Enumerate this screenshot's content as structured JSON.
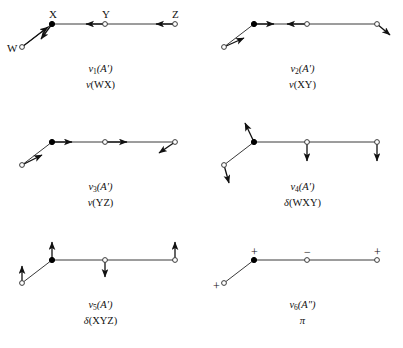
{
  "figure": {
    "background_color": "#ffffff",
    "line_color": "#3a3a3a",
    "marker_fill_color": "#000000",
    "marker_open_color": "#ffffff",
    "arrow_color": "#111111",
    "atom_labels": [
      "W",
      "X",
      "Y",
      "Z"
    ]
  },
  "panels": [
    {
      "id": "mode-1",
      "mode_label": "ν",
      "mode_index": "1",
      "symmetry": "(A′)",
      "coordinate_symbol": "ν",
      "coordinate_group": "(WX)",
      "caption_line1": "ν₁(A′)",
      "caption_line2": "ν(WX)",
      "show_atom_labels": true,
      "atoms": [
        {
          "name": "W",
          "x": 22,
          "y": 47,
          "type": "open",
          "label": "W",
          "label_dx": -15,
          "label_dy": -4
        },
        {
          "name": "X",
          "x": 52,
          "y": 24,
          "type": "filled",
          "label": "X",
          "label_dx": -3,
          "label_dy": -15
        },
        {
          "name": "Y",
          "x": 105,
          "y": 24,
          "type": "open",
          "label": "Y",
          "label_dx": -3,
          "label_dy": -15
        },
        {
          "name": "Z",
          "x": 175,
          "y": 24,
          "type": "open",
          "label": "Z",
          "label_dx": -3,
          "label_dy": -15
        }
      ],
      "arrows": [
        {
          "atom": "W",
          "dx": 26,
          "dy": -20,
          "len": 33,
          "kind": "diagonal-up-right"
        },
        {
          "atom": "X",
          "dx": -11,
          "dy": 15,
          "len": 19,
          "kind": "diagonal-down-left"
        },
        {
          "atom": "Y",
          "dx": -19,
          "dy": 0,
          "len": 19,
          "kind": "left"
        },
        {
          "atom": "Z",
          "dx": -19,
          "dy": 0,
          "len": 19,
          "kind": "left"
        }
      ],
      "signs": []
    },
    {
      "id": "mode-2",
      "mode_label": "ν",
      "mode_index": "2",
      "symmetry": "(A′)",
      "coordinate_symbol": "ν",
      "coordinate_group": "(XY)",
      "caption_line1": "ν₂(A′)",
      "caption_line2": "ν(XY)",
      "show_atom_labels": false,
      "atoms": [
        {
          "name": "W",
          "x": 22,
          "y": 47,
          "type": "open"
        },
        {
          "name": "X",
          "x": 52,
          "y": 24,
          "type": "filled"
        },
        {
          "name": "Y",
          "x": 105,
          "y": 24,
          "type": "open"
        },
        {
          "name": "Z",
          "x": 175,
          "y": 24,
          "type": "open"
        }
      ],
      "arrows": [
        {
          "atom": "W",
          "dx": 20,
          "dy": -9,
          "len": 22,
          "kind": "diagonal-up-right"
        },
        {
          "atom": "X",
          "dx": 20,
          "dy": 0,
          "len": 20,
          "kind": "right"
        },
        {
          "atom": "Y",
          "dx": -20,
          "dy": 0,
          "len": 20,
          "kind": "left"
        },
        {
          "atom": "Z",
          "dx": 13,
          "dy": 11,
          "len": 17,
          "kind": "diagonal-down-right"
        }
      ],
      "signs": []
    },
    {
      "id": "mode-3",
      "mode_label": "ν",
      "mode_index": "3",
      "symmetry": "(A′)",
      "coordinate_symbol": "ν",
      "coordinate_group": "(YZ)",
      "caption_line1": "ν₃(A′)",
      "caption_line2": "ν(YZ)",
      "show_atom_labels": false,
      "atoms": [
        {
          "name": "W",
          "x": 22,
          "y": 47,
          "type": "open"
        },
        {
          "name": "X",
          "x": 52,
          "y": 24,
          "type": "filled"
        },
        {
          "name": "Y",
          "x": 105,
          "y": 24,
          "type": "open"
        },
        {
          "name": "Z",
          "x": 175,
          "y": 24,
          "type": "open"
        }
      ],
      "arrows": [
        {
          "atom": "W",
          "dx": 20,
          "dy": -10,
          "len": 22,
          "kind": "diagonal-up-right"
        },
        {
          "atom": "X",
          "dx": 20,
          "dy": 0,
          "len": 20,
          "kind": "right"
        },
        {
          "atom": "Y",
          "dx": 22,
          "dy": 0,
          "len": 22,
          "kind": "right"
        },
        {
          "atom": "Z",
          "dx": -16,
          "dy": 11,
          "len": 19,
          "kind": "diagonal-down-left"
        }
      ],
      "signs": []
    },
    {
      "id": "mode-4",
      "mode_label": "ν",
      "mode_index": "4",
      "symmetry": "(A′)",
      "coordinate_symbol": "δ",
      "coordinate_group": "(WXY)",
      "caption_line1": "ν₄(A′)",
      "caption_line2": "δ(WXY)",
      "show_atom_labels": false,
      "atoms": [
        {
          "name": "W",
          "x": 22,
          "y": 47,
          "type": "open"
        },
        {
          "name": "X",
          "x": 52,
          "y": 24,
          "type": "filled"
        },
        {
          "name": "Y",
          "x": 105,
          "y": 24,
          "type": "open"
        },
        {
          "name": "Z",
          "x": 175,
          "y": 24,
          "type": "open"
        }
      ],
      "arrows": [
        {
          "atom": "W",
          "dx": 5,
          "dy": 18,
          "len": 19,
          "kind": "diagonal-down-right"
        },
        {
          "atom": "X",
          "dx": -9,
          "dy": -19,
          "len": 21,
          "kind": "diagonal-up-left"
        },
        {
          "atom": "Y",
          "dx": 0,
          "dy": 19,
          "len": 19,
          "kind": "down"
        },
        {
          "atom": "Z",
          "dx": 0,
          "dy": 19,
          "len": 19,
          "kind": "down"
        }
      ],
      "signs": []
    },
    {
      "id": "mode-5",
      "mode_label": "ν",
      "mode_index": "5",
      "symmetry": "(A′)",
      "coordinate_symbol": "δ",
      "coordinate_group": "(XYZ)",
      "caption_line1": "ν₅(A′)",
      "caption_line2": "δ(XYZ)",
      "show_atom_labels": false,
      "atoms": [
        {
          "name": "W",
          "x": 22,
          "y": 47,
          "type": "open"
        },
        {
          "name": "X",
          "x": 52,
          "y": 24,
          "type": "filled"
        },
        {
          "name": "Y",
          "x": 105,
          "y": 24,
          "type": "open"
        },
        {
          "name": "Z",
          "x": 175,
          "y": 24,
          "type": "open"
        }
      ],
      "arrows": [
        {
          "atom": "W",
          "dx": 0,
          "dy": -17,
          "len": 17,
          "kind": "up"
        },
        {
          "atom": "X",
          "dx": 0,
          "dy": -18,
          "len": 18,
          "kind": "up"
        },
        {
          "atom": "Y",
          "dx": 0,
          "dy": 17,
          "len": 17,
          "kind": "down"
        },
        {
          "atom": "Z",
          "dx": 0,
          "dy": -18,
          "len": 18,
          "kind": "up"
        }
      ],
      "signs": []
    },
    {
      "id": "mode-6",
      "mode_label": "ν",
      "mode_index": "6",
      "symmetry": "(A″)",
      "coordinate_symbol": "π",
      "coordinate_group": "",
      "caption_line1": "ν₆(A″)",
      "caption_line2": "π",
      "show_atom_labels": false,
      "atoms": [
        {
          "name": "W",
          "x": 22,
          "y": 47,
          "type": "open"
        },
        {
          "name": "X",
          "x": 52,
          "y": 24,
          "type": "filled"
        },
        {
          "name": "Y",
          "x": 105,
          "y": 24,
          "type": "open"
        },
        {
          "name": "Z",
          "x": 175,
          "y": 24,
          "type": "open"
        }
      ],
      "arrows": [],
      "signs": [
        {
          "atom": "W",
          "text": "+",
          "dx": -11,
          "dy": -3
        },
        {
          "atom": "X",
          "text": "+",
          "dx": -3,
          "dy": -14
        },
        {
          "atom": "Y",
          "text": "−",
          "dx": -3,
          "dy": -14
        },
        {
          "atom": "Z",
          "text": "+",
          "dx": -3,
          "dy": -14
        }
      ]
    }
  ],
  "chart_data": {
    "type": "diagram",
    "atoms": [
      "W",
      "X",
      "Y",
      "Z"
    ],
    "bonds": [
      [
        "W",
        "X"
      ],
      [
        "X",
        "Y"
      ],
      [
        "Y",
        "Z"
      ]
    ],
    "geometry": {
      "W": [
        22,
        47
      ],
      "X": [
        52,
        24
      ],
      "Y": [
        105,
        24
      ],
      "Z": [
        175,
        24
      ]
    },
    "modes": [
      {
        "name": "ν1",
        "symmetry": "A′",
        "internal_coordinate": "ν(WX)",
        "description": "W-X stretch",
        "displacements": {
          "W": "up-right diagonal (toward X)",
          "X": "down-left diagonal (toward W)",
          "Y": "left",
          "Z": "left"
        }
      },
      {
        "name": "ν2",
        "symmetry": "A′",
        "internal_coordinate": "ν(XY)",
        "description": "X-Y stretch",
        "displacements": {
          "W": "up-right diagonal",
          "X": "right",
          "Y": "left",
          "Z": "down-right diagonal"
        }
      },
      {
        "name": "ν3",
        "symmetry": "A′",
        "internal_coordinate": "ν(YZ)",
        "description": "Y-Z stretch",
        "displacements": {
          "W": "up-right diagonal",
          "X": "right",
          "Y": "right",
          "Z": "down-left diagonal"
        }
      },
      {
        "name": "ν4",
        "symmetry": "A′",
        "internal_coordinate": "δ(WXY)",
        "description": "W-X-Y in-plane bend",
        "displacements": {
          "W": "down-right diagonal",
          "X": "up-left diagonal",
          "Y": "down",
          "Z": "down"
        }
      },
      {
        "name": "ν5",
        "symmetry": "A′",
        "internal_coordinate": "δ(XYZ)",
        "description": "X-Y-Z in-plane bend",
        "displacements": {
          "W": "up",
          "X": "up",
          "Y": "down",
          "Z": "up"
        }
      },
      {
        "name": "ν6",
        "symmetry": "A″",
        "internal_coordinate": "π",
        "description": "Out-of-plane bend, indicated by + and − signs",
        "displacements": {
          "W": "+",
          "X": "+",
          "Y": "−",
          "Z": "+"
        }
      }
    ]
  }
}
